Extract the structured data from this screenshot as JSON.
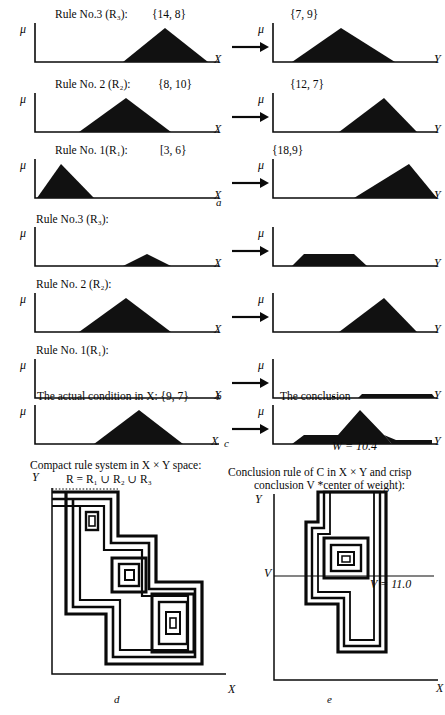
{
  "figure": {
    "title_parts": [
      "a",
      "b",
      "c",
      "d",
      "e"
    ],
    "axis_labels": {
      "x": "X",
      "y": "Y",
      "mu": "μ",
      "v": "V",
      "yprime": "Y"
    }
  },
  "section_a": {
    "caption": "a",
    "rows": [
      {
        "antecedent_label": "Rule No.3 (R₃):",
        "antecedent_set": "{14, 8}",
        "consequent_set": "{7, 9}",
        "x_axis": "X",
        "y_axis": "Y",
        "mu": "μ",
        "antecedent_shape": {
          "type": "triangle",
          "left": 0.48,
          "peak": 0.7,
          "right": 0.93,
          "height": 1.0
        },
        "consequent_shape": {
          "type": "triangle",
          "left": 0.12,
          "peak": 0.42,
          "right": 0.75,
          "height": 1.0
        }
      },
      {
        "antecedent_label": "Rule No. 2 (R₂):",
        "antecedent_set": "{8, 10}",
        "consequent_set": "{12, 7}",
        "x_axis": "X",
        "y_axis": "Y",
        "mu": "μ",
        "antecedent_shape": {
          "type": "triangle",
          "left": 0.24,
          "peak": 0.49,
          "right": 0.73,
          "height": 1.0
        },
        "consequent_shape": {
          "type": "triangle",
          "left": 0.41,
          "peak": 0.68,
          "right": 0.88,
          "height": 1.0
        }
      },
      {
        "antecedent_label": "Rule No. 1(R₁):",
        "antecedent_set": "[3, 6}",
        "consequent_set": "{18,9}",
        "x_axis": "X",
        "y_axis": "Y",
        "mu": "μ",
        "antecedent_shape": {
          "type": "triangle",
          "left": 0.01,
          "peak": 0.145,
          "right": 0.32,
          "height": 1.0
        },
        "consequent_shape": {
          "type": "triangle",
          "left": 0.5,
          "peak": 0.83,
          "right": 1.0,
          "height": 1.0
        }
      }
    ]
  },
  "section_b": {
    "caption": "b",
    "rows": [
      {
        "antecedent_label": "Rule No.3 (R₃):",
        "x_axis": "X",
        "y_axis": "Y",
        "mu": "μ",
        "antecedent_shape": {
          "type": "triangle",
          "left": 0.48,
          "peak": 0.61,
          "right": 0.74,
          "height": 0.3
        },
        "consequent_shape": {
          "type": "trapezoid",
          "left": 0.12,
          "ltop": 0.25,
          "rtop": 0.6,
          "right": 0.7,
          "height": 0.3
        }
      },
      {
        "antecedent_label": "Rule No. 2 (R₂):",
        "x_axis": "X",
        "y_axis": "Y",
        "mu": "μ",
        "antecedent_shape": {
          "type": "triangle",
          "left": 0.24,
          "peak": 0.49,
          "right": 0.73,
          "height": 1.0
        },
        "consequent_shape": {
          "type": "triangle",
          "left": 0.41,
          "peak": 0.68,
          "right": 0.88,
          "height": 1.0
        }
      },
      {
        "antecedent_label": "Rule No. 1(R₁):",
        "x_axis": "X",
        "y_axis": "Y",
        "mu": "μ",
        "antecedent_shape": {
          "type": "flat",
          "left": 0.0,
          "right": 1.0,
          "height": 0.0
        },
        "consequent_shape": {
          "type": "trapezoid",
          "left": 0.52,
          "ltop": 0.55,
          "rtop": 0.97,
          "right": 1.0,
          "height": 0.055
        }
      }
    ]
  },
  "section_c": {
    "caption": "c",
    "input_label": "The actual condition in X: {9, 7}",
    "output_label": "The conclusion",
    "x_axis": "X",
    "y_axis": "Y",
    "mu": "μ",
    "input_shape": {
      "type": "triangle",
      "left": 0.32,
      "peak": 0.56,
      "right": 0.8,
      "height": 1.0
    },
    "conclusion_value_label": "W = 10.4"
  },
  "section_d": {
    "caption": "d",
    "title_line1": "Compact rule system in X × Y space:",
    "title_line2": "R = R₁ ∪ R₂ ∪ R₃",
    "x_axis": "X",
    "y_axis": "Y"
  },
  "section_e": {
    "caption": "e",
    "title_line1": "Conclusion rule of C in X × Y and crisp",
    "title_line2": "conclusion V *center of weight):",
    "x_axis": "X",
    "y_axis": "Y",
    "v_axis": "V",
    "v_value_label": "V = 11.0"
  },
  "colors": {
    "ink": "#0a0a0a",
    "fill": "#111111",
    "background": "#ffffff"
  }
}
